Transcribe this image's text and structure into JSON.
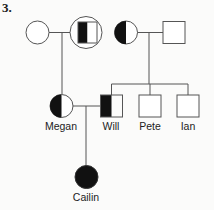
{
  "problem_number": "3.",
  "pedigree": {
    "individuals": [
      {
        "id": "gen1-female-left",
        "sex": "female",
        "fill": "unaffected",
        "label": ""
      },
      {
        "id": "gen1-male-circled",
        "sex": "male",
        "fill": "left-half",
        "circled": true,
        "label": ""
      },
      {
        "id": "gen1-female-right",
        "sex": "female",
        "fill": "left-half",
        "label": ""
      },
      {
        "id": "gen1-male-right",
        "sex": "male",
        "fill": "unaffected",
        "label": ""
      },
      {
        "id": "megan",
        "sex": "female",
        "fill": "left-half",
        "label": "Megan"
      },
      {
        "id": "will",
        "sex": "male",
        "fill": "left-half",
        "label": "Will"
      },
      {
        "id": "pete",
        "sex": "male",
        "fill": "unaffected",
        "label": "Pete"
      },
      {
        "id": "ian",
        "sex": "male",
        "fill": "unaffected",
        "label": "Ian"
      },
      {
        "id": "cailin",
        "sex": "female",
        "fill": "affected",
        "label": "Cailin"
      }
    ],
    "labels": {
      "megan": "Megan",
      "will": "Will",
      "pete": "Pete",
      "ian": "Ian",
      "cailin": "Cailin"
    },
    "colors": {
      "line": "#555555",
      "fill": "#111111",
      "background": "#fbfbfa"
    }
  }
}
